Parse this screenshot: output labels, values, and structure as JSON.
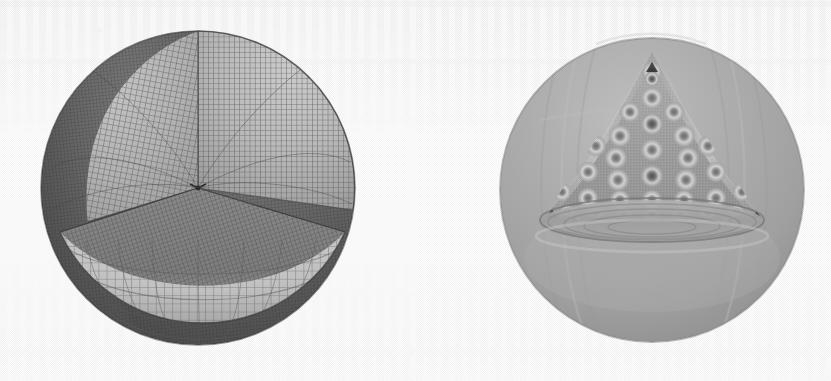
{
  "figure": {
    "background_color": "#fdfdfd",
    "panel_count": 2,
    "media_type": "scanned-grayscale-figure",
    "left_panel": {
      "name": "sphere-octant-mesh",
      "description": "Sphere with one octant removed showing structured quadrilateral surface mesh on the interior cut faces",
      "center_x": 198,
      "center_y": 188,
      "radius": 157,
      "shell_shadow_color": "#575757",
      "cut_face_color": "#b6b6b6",
      "cut_plane_color": "#8c8c8c",
      "lower_bowl_color": "#c4c4c4",
      "mesh_line_color": "#4e4e4e",
      "mesh_meridians": 46,
      "mesh_parallels": 40,
      "apex_vertex_x": 198,
      "apex_vertex_y": 188
    },
    "right_panel": {
      "name": "sphere-interior-field",
      "description": "Sphere with a conical wedge removed revealing an interior contour field of ring shaped lobes arranged in a triangular lattice",
      "center_x": 652,
      "center_y": 190,
      "radius": 152,
      "shell_color": "#a9a9a9",
      "shell_light_color": "#bdbdbd",
      "shell_dark_color": "#8f8f8f",
      "cone_fill_color": "#9d9d9d",
      "lobe_ring_light": "#d2d2d2",
      "lobe_core_dark": "#6a6a6a",
      "cut_ellipse_y": 220,
      "cut_ellipse_rx": 112,
      "cut_ellipse_ry": 22,
      "cone_apex_x": 652,
      "cone_apex_y": 58,
      "lobe_rows": [
        1,
        2,
        3,
        4,
        5,
        6,
        7,
        8
      ]
    }
  },
  "chart_data": {
    "type": "heatmap",
    "title": "",
    "subtitle": "",
    "xlabel": "",
    "ylabel": "",
    "panels": [
      {
        "label": "left",
        "kind": "mesh",
        "geometry": "sphere-octant-cutaway",
        "surface_mesh": "structured quadrilateral",
        "meridian_divisions": 46,
        "parallel_divisions": 40,
        "shading_levels": [
          "#575757",
          "#8c8c8c",
          "#b6b6b6",
          "#c4c4c4"
        ]
      },
      {
        "label": "right",
        "kind": "field",
        "geometry": "sphere-cone-cutaway",
        "field": "interior scalar eigenmode magnitude",
        "lobe_lattice": "triangular",
        "lobes_per_row": [
          1,
          2,
          3,
          4,
          5,
          6,
          7,
          8
        ],
        "total_lobes": 36,
        "colormap": "grayscale",
        "value_range": [
          0,
          1
        ],
        "shading_levels": [
          "#6a6a6a",
          "#9d9d9d",
          "#a9a9a9",
          "#bdbdbd",
          "#d2d2d2"
        ]
      }
    ],
    "legend": [],
    "grid": false
  }
}
